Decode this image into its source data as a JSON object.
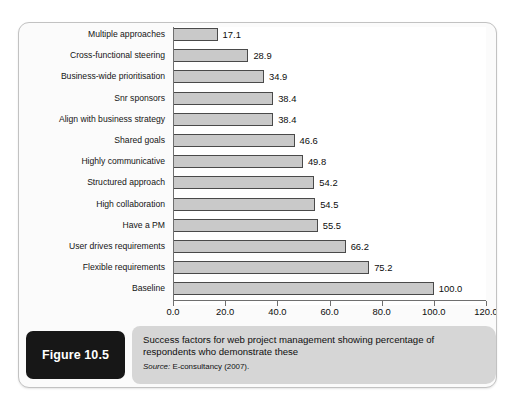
{
  "figure": {
    "number_label": "Figure 10.5",
    "caption": "Success factors for web project management showing percentage of respondents who demonstrate these",
    "source_label": "Source:",
    "source_text": " E-consultancy (2007)."
  },
  "colors": {
    "bar_fill": "#c9c9c9",
    "bar_border": "#4a4a4a",
    "axis": "#6f6f6f",
    "caption_panel": "#d6d6d6",
    "figure_box": "#171717",
    "plot_background": "#ffffff",
    "card_background": "#fbfbfb"
  },
  "chart_data": {
    "type": "bar",
    "orientation": "horizontal",
    "title": "",
    "xlabel": "",
    "ylabel": "",
    "xlim": [
      0,
      120
    ],
    "grid": false,
    "legend": "none",
    "xticks": [
      "0.0",
      "20.0",
      "40.0",
      "60.0",
      "80.0",
      "100.0",
      "120.0"
    ],
    "xtick_values": [
      0,
      20,
      40,
      60,
      80,
      100,
      120
    ],
    "categories": [
      "Multiple approaches",
      "Cross-functional steering",
      "Business-wide prioritisation",
      "Snr sponsors",
      "Align with business strategy",
      "Shared goals",
      "Highly communicative",
      "Structured approach",
      "High collaboration",
      "Have a PM",
      "User drives requirements",
      "Flexible requirements",
      "Baseline"
    ],
    "values": [
      17.1,
      28.9,
      34.9,
      38.4,
      38.4,
      46.6,
      49.8,
      54.2,
      54.5,
      55.5,
      66.2,
      75.2,
      100.0
    ],
    "value_labels": [
      "17.1",
      "28.9",
      "34.9",
      "38.4",
      "38.4",
      "46.6",
      "49.8",
      "54.2",
      "54.5",
      "55.5",
      "66.2",
      "75.2",
      "100.0"
    ]
  }
}
